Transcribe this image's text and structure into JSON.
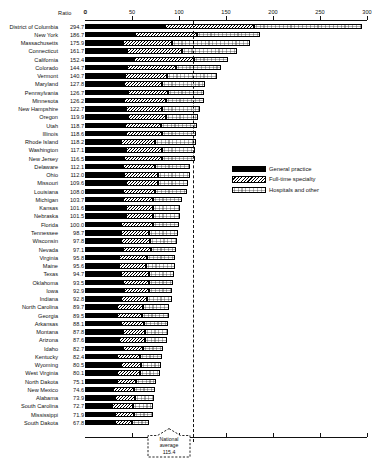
{
  "header": {
    "ratio_label": "Ratio",
    "zero_label": "0"
  },
  "legend": {
    "items": [
      {
        "label": "General practice",
        "pattern": "solid-black"
      },
      {
        "label": "Full-time specialty",
        "pattern": "diagonal-hatch"
      },
      {
        "label": "Hospitals and other",
        "pattern": "light-stipple"
      }
    ]
  },
  "annotation": {
    "line1": "National",
    "line2": "average",
    "line3": "115.4",
    "value": 115.4
  },
  "chart_data": {
    "type": "bar",
    "orientation": "horizontal",
    "stacked": true,
    "title": "",
    "xlabel": "Ratio",
    "ylabel": "",
    "xlim": [
      0,
      300
    ],
    "xticks": [
      0,
      50,
      100,
      150,
      200,
      250,
      300
    ],
    "grid": false,
    "legend_position": "middle-right",
    "reference_line": {
      "label": "National average",
      "value": 115.4,
      "style": "dashed"
    },
    "series": [
      {
        "name": "General practice",
        "pattern": "solid-black"
      },
      {
        "name": "Full-time specialty",
        "pattern": "diagonal-hatch"
      },
      {
        "name": "Hospitals and other",
        "pattern": "light-stipple"
      }
    ],
    "categories": [
      "District of Columbia",
      "New York",
      "Massachusetts",
      "Connecticut",
      "California",
      "Colorado",
      "Vermont",
      "Maryland",
      "Pennsylvania",
      "Minnesota",
      "New Hampshire",
      "Oregon",
      "Utah",
      "Illinois",
      "Rhode Island",
      "Washington",
      "New Jersey",
      "Delaware",
      "Ohio",
      "Missouri",
      "Louisiana",
      "Michigan",
      "Kansas",
      "Nebraska",
      "Florida",
      "Tennessee",
      "Wisconsin",
      "Nevada",
      "Virginia",
      "Maine",
      "Texas",
      "Oklahoma",
      "Iowa",
      "Indiana",
      "North Carolina",
      "Georgia",
      "Arkansas",
      "Montana",
      "Arizona",
      "Idaho",
      "Kentucky",
      "Wyoming",
      "West Virginia",
      "North Dakota",
      "New Mexico",
      "Alabama",
      "South Carolina",
      "Mississippi",
      "South Dakota"
    ],
    "values": [
      294.7,
      186.7,
      175.9,
      161.7,
      152.4,
      144.7,
      140.7,
      127.8,
      126.7,
      126.2,
      122.7,
      119.9,
      118.7,
      118.6,
      118.2,
      117.1,
      116.5,
      112.1,
      112.0,
      109.6,
      108.0,
      103.7,
      101.6,
      101.5,
      100.0,
      98.7,
      97.8,
      97.1,
      95.8,
      95.6,
      94.7,
      93.5,
      92.9,
      92.8,
      89.7,
      89.5,
      88.1,
      87.8,
      87.6,
      82.7,
      82.4,
      80.5,
      80.1,
      75.1,
      74.6,
      73.9,
      72.7,
      71.9,
      67.8
    ],
    "rows": [
      {
        "state": "District of Columbia",
        "ratio": 294.7,
        "general_practice": 85.0,
        "full_time_specialty": 95.0,
        "hospitals_and_other": 114.7
      },
      {
        "state": "New York",
        "ratio": 186.7,
        "general_practice": 53.0,
        "full_time_specialty": 66.0,
        "hospitals_and_other": 67.7
      },
      {
        "state": "Massachusetts",
        "ratio": 175.9,
        "general_practice": 40.0,
        "full_time_specialty": 53.0,
        "hospitals_and_other": 82.9
      },
      {
        "state": "Connecticut",
        "ratio": 161.7,
        "general_practice": 45.0,
        "full_time_specialty": 58.0,
        "hospitals_and_other": 58.7
      },
      {
        "state": "California",
        "ratio": 152.4,
        "general_practice": 52.0,
        "full_time_specialty": 64.0,
        "hospitals_and_other": 36.4
      },
      {
        "state": "Colorado",
        "ratio": 144.7,
        "general_practice": 45.0,
        "full_time_specialty": 52.0,
        "hospitals_and_other": 47.7
      },
      {
        "state": "Vermont",
        "ratio": 140.7,
        "general_practice": 43.0,
        "full_time_specialty": 44.0,
        "hospitals_and_other": 53.7
      },
      {
        "state": "Maryland",
        "ratio": 127.8,
        "general_practice": 42.0,
        "full_time_specialty": 40.0,
        "hospitals_and_other": 45.8
      },
      {
        "state": "Pennsylvania",
        "ratio": 126.7,
        "general_practice": 46.0,
        "full_time_specialty": 42.0,
        "hospitals_and_other": 38.7
      },
      {
        "state": "Minnesota",
        "ratio": 126.2,
        "general_practice": 42.0,
        "full_time_specialty": 44.0,
        "hospitals_and_other": 40.2
      },
      {
        "state": "New Hampshire",
        "ratio": 122.7,
        "general_practice": 44.0,
        "full_time_specialty": 38.0,
        "hospitals_and_other": 40.7
      },
      {
        "state": "Oregon",
        "ratio": 119.9,
        "general_practice": 46.0,
        "full_time_specialty": 40.0,
        "hospitals_and_other": 33.9
      },
      {
        "state": "Utah",
        "ratio": 118.7,
        "general_practice": 43.0,
        "full_time_specialty": 38.0,
        "hospitals_and_other": 37.7
      },
      {
        "state": "Illinois",
        "ratio": 118.6,
        "general_practice": 44.0,
        "full_time_specialty": 38.0,
        "hospitals_and_other": 36.6
      },
      {
        "state": "Rhode Island",
        "ratio": 118.2,
        "general_practice": 38.0,
        "full_time_specialty": 36.0,
        "hospitals_and_other": 44.2
      },
      {
        "state": "Washington",
        "ratio": 117.1,
        "general_practice": 44.0,
        "full_time_specialty": 38.0,
        "hospitals_and_other": 35.1
      },
      {
        "state": "New Jersey",
        "ratio": 116.5,
        "general_practice": 42.0,
        "full_time_specialty": 40.0,
        "hospitals_and_other": 34.5
      },
      {
        "state": "Delaware",
        "ratio": 112.1,
        "general_practice": 40.0,
        "full_time_specialty": 34.0,
        "hospitals_and_other": 38.1
      },
      {
        "state": "Ohio",
        "ratio": 112.0,
        "general_practice": 42.0,
        "full_time_specialty": 36.0,
        "hospitals_and_other": 34.0
      },
      {
        "state": "Missouri",
        "ratio": 109.6,
        "general_practice": 44.0,
        "full_time_specialty": 34.0,
        "hospitals_and_other": 31.6
      },
      {
        "state": "Louisiana",
        "ratio": 108.0,
        "general_practice": 40.0,
        "full_time_specialty": 34.0,
        "hospitals_and_other": 34.0
      },
      {
        "state": "Michigan",
        "ratio": 103.7,
        "general_practice": 40.0,
        "full_time_specialty": 32.0,
        "hospitals_and_other": 31.7
      },
      {
        "state": "Kansas",
        "ratio": 101.6,
        "general_practice": 44.0,
        "full_time_specialty": 28.0,
        "hospitals_and_other": 29.6
      },
      {
        "state": "Nebraska",
        "ratio": 101.5,
        "general_practice": 44.0,
        "full_time_specialty": 28.0,
        "hospitals_and_other": 29.5
      },
      {
        "state": "Florida",
        "ratio": 100.0,
        "general_practice": 38.0,
        "full_time_specialty": 34.0,
        "hospitals_and_other": 28.0
      },
      {
        "state": "Tennessee",
        "ratio": 98.7,
        "general_practice": 38.0,
        "full_time_specialty": 30.0,
        "hospitals_and_other": 30.7
      },
      {
        "state": "Wisconsin",
        "ratio": 97.8,
        "general_practice": 38.0,
        "full_time_specialty": 31.0,
        "hospitals_and_other": 28.8
      },
      {
        "state": "Nevada",
        "ratio": 97.1,
        "general_practice": 40.0,
        "full_time_specialty": 30.0,
        "hospitals_and_other": 27.1
      },
      {
        "state": "Virginia",
        "ratio": 95.8,
        "general_practice": 36.0,
        "full_time_specialty": 30.0,
        "hospitals_and_other": 29.8
      },
      {
        "state": "Maine",
        "ratio": 95.6,
        "general_practice": 36.0,
        "full_time_specialty": 29.0,
        "hospitals_and_other": 30.6
      },
      {
        "state": "Texas",
        "ratio": 94.7,
        "general_practice": 38.0,
        "full_time_specialty": 30.0,
        "hospitals_and_other": 26.7
      },
      {
        "state": "Oklahoma",
        "ratio": 93.5,
        "general_practice": 40.0,
        "full_time_specialty": 28.0,
        "hospitals_and_other": 25.5
      },
      {
        "state": "Iowa",
        "ratio": 92.9,
        "general_practice": 42.0,
        "full_time_specialty": 26.0,
        "hospitals_and_other": 24.9
      },
      {
        "state": "Indiana",
        "ratio": 92.8,
        "general_practice": 38.0,
        "full_time_specialty": 28.0,
        "hospitals_and_other": 26.8
      },
      {
        "state": "North Carolina",
        "ratio": 89.7,
        "general_practice": 34.0,
        "full_time_specialty": 28.0,
        "hospitals_and_other": 27.7
      },
      {
        "state": "Georgia",
        "ratio": 89.5,
        "general_practice": 34.0,
        "full_time_specialty": 27.0,
        "hospitals_and_other": 28.5
      },
      {
        "state": "Arkansas",
        "ratio": 88.1,
        "general_practice": 38.0,
        "full_time_specialty": 25.0,
        "hospitals_and_other": 25.1
      },
      {
        "state": "Montana",
        "ratio": 87.8,
        "general_practice": 40.0,
        "full_time_specialty": 24.0,
        "hospitals_and_other": 23.8
      },
      {
        "state": "Arizona",
        "ratio": 87.6,
        "general_practice": 36.0,
        "full_time_specialty": 28.0,
        "hospitals_and_other": 23.6
      },
      {
        "state": "Idaho",
        "ratio": 82.7,
        "general_practice": 40.0,
        "full_time_specialty": 22.0,
        "hospitals_and_other": 20.7
      },
      {
        "state": "Kentucky",
        "ratio": 82.4,
        "general_practice": 34.0,
        "full_time_specialty": 24.0,
        "hospitals_and_other": 24.4
      },
      {
        "state": "Wyoming",
        "ratio": 80.5,
        "general_practice": 38.0,
        "full_time_specialty": 22.0,
        "hospitals_and_other": 20.5
      },
      {
        "state": "West Virginia",
        "ratio": 80.1,
        "general_practice": 34.0,
        "full_time_specialty": 24.0,
        "hospitals_and_other": 22.1
      },
      {
        "state": "North Dakota",
        "ratio": 75.1,
        "general_practice": 34.0,
        "full_time_specialty": 20.0,
        "hospitals_and_other": 21.1
      },
      {
        "state": "New Mexico",
        "ratio": 74.6,
        "general_practice": 30.0,
        "full_time_specialty": 22.0,
        "hospitals_and_other": 22.6
      },
      {
        "state": "Alabama",
        "ratio": 73.9,
        "general_practice": 32.0,
        "full_time_specialty": 21.0,
        "hospitals_and_other": 20.9
      },
      {
        "state": "South Carolina",
        "ratio": 72.7,
        "general_practice": 29.0,
        "full_time_specialty": 22.0,
        "hospitals_and_other": 21.7
      },
      {
        "state": "Mississippi",
        "ratio": 71.9,
        "general_practice": 32.0,
        "full_time_specialty": 20.0,
        "hospitals_and_other": 19.9
      },
      {
        "state": "South Dakota",
        "ratio": 67.8,
        "general_practice": 32.0,
        "full_time_specialty": 18.0,
        "hospitals_and_other": 17.8
      }
    ]
  }
}
